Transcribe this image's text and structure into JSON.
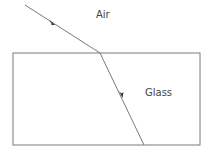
{
  "diagram": {
    "labels": {
      "air": "Air",
      "glass": "Glass"
    },
    "colors": {
      "line": "#7a7a7a",
      "text": "#444444",
      "background": "#ffffff"
    },
    "glass_block": {
      "x": 13,
      "y": 53,
      "width": 187,
      "height": 92
    },
    "incident_ray": {
      "from": [
        25,
        5
      ],
      "to": [
        100,
        53
      ]
    },
    "refracted_ray": {
      "from": [
        100,
        53
      ],
      "to": [
        144,
        145
      ]
    }
  }
}
